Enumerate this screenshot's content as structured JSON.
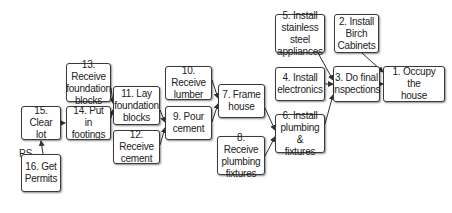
{
  "diagram": {
    "type": "precedence network",
    "nodes": [
      {
        "id": "1",
        "label": "1. Occupy the\nhouse",
        "x": 383,
        "y": 66,
        "w": 62,
        "h": 36
      },
      {
        "id": "2",
        "label": "2. Install\nBirch\nCabinets",
        "x": 334,
        "y": 14,
        "w": 45,
        "h": 39
      },
      {
        "id": "3",
        "label": "3. Do final\ninspections",
        "x": 333,
        "y": 66,
        "w": 47,
        "h": 36
      },
      {
        "id": "4",
        "label": "4. Install\nelectronics",
        "x": 275,
        "y": 67,
        "w": 50,
        "h": 34
      },
      {
        "id": "5",
        "label": "5. Install\nstainless steel\nappliances",
        "x": 275,
        "y": 14,
        "w": 50,
        "h": 39
      },
      {
        "id": "6",
        "label": "6. Install\nplumbing &\nfixtures",
        "x": 275,
        "y": 114,
        "w": 50,
        "h": 39
      },
      {
        "id": "7",
        "label": "7. Frame\nhouse",
        "x": 218,
        "y": 84,
        "w": 47,
        "h": 34
      },
      {
        "id": "8",
        "label": "8. Receive\nplumbing\nfixtures",
        "x": 217,
        "y": 136,
        "w": 48,
        "h": 39
      },
      {
        "id": "9",
        "label": "9. Pour\ncement",
        "x": 165,
        "y": 106,
        "w": 47,
        "h": 34
      },
      {
        "id": "10",
        "label": "10. Receive\nlumber",
        "x": 165,
        "y": 66,
        "w": 47,
        "h": 34
      },
      {
        "id": "11",
        "label": "11. Lay\nfoundation\nblocks",
        "x": 113,
        "y": 86,
        "w": 47,
        "h": 39
      },
      {
        "id": "12",
        "label": "12. Receive\ncement",
        "x": 113,
        "y": 130,
        "w": 47,
        "h": 34
      },
      {
        "id": "13",
        "label": "13. Receive\nfoundation\nblocks",
        "x": 66,
        "y": 63,
        "w": 45,
        "h": 39
      },
      {
        "id": "14",
        "label": "14. Put in\nfootings",
        "x": 66,
        "y": 106,
        "w": 45,
        "h": 34
      },
      {
        "id": "15",
        "label": "15. Clear\nlot",
        "x": 21,
        "y": 106,
        "w": 40,
        "h": 34
      },
      {
        "id": "16",
        "label": "16. Get\nPermits",
        "x": 21,
        "y": 154,
        "w": 40,
        "h": 38
      }
    ],
    "edges": [
      [
        "16",
        "15"
      ],
      [
        "15",
        "14"
      ],
      [
        "13",
        "11"
      ],
      [
        "14",
        "11"
      ],
      [
        "11",
        "9"
      ],
      [
        "12",
        "9"
      ],
      [
        "10",
        "7"
      ],
      [
        "9",
        "7"
      ],
      [
        "7",
        "6"
      ],
      [
        "8",
        "6"
      ],
      [
        "6",
        "3"
      ],
      [
        "4",
        "3"
      ],
      [
        "5",
        "3"
      ],
      [
        "3",
        "1"
      ],
      [
        "2",
        "1"
      ]
    ],
    "start_label": "PS",
    "colors": {
      "border": "#3a3a3a",
      "text": "#222222",
      "edge": "#333333",
      "background": "#ffffff"
    }
  }
}
